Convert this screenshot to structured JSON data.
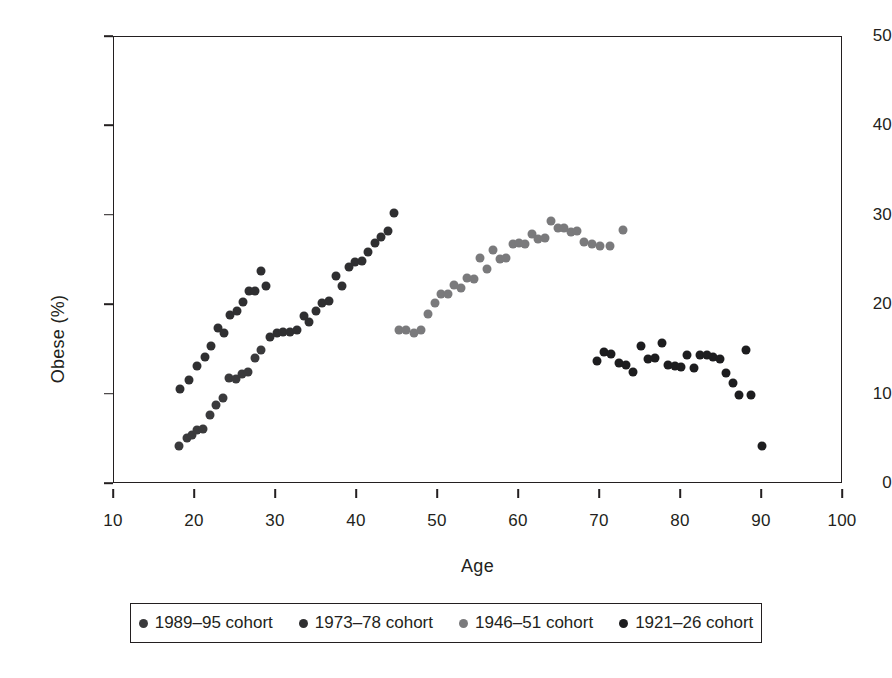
{
  "chart_data": {
    "type": "scatter",
    "title": "",
    "xlabel": "Age",
    "ylabel": "Obese (%)",
    "xlim": [
      10,
      100
    ],
    "ylim": [
      0,
      50
    ],
    "xticks": [
      10,
      20,
      30,
      40,
      50,
      60,
      70,
      80,
      90,
      100
    ],
    "yticks": [
      0,
      10,
      20,
      30,
      40,
      50
    ],
    "grid": false,
    "legend_position": "below",
    "marker_size_px": 9,
    "series": [
      {
        "name": "1989–95 cohort",
        "color": "#3a3a3c",
        "points": [
          [
            18.0,
            4.2
          ],
          [
            19.0,
            5.1
          ],
          [
            19.6,
            5.5
          ],
          [
            20.2,
            6.0
          ],
          [
            21.0,
            6.2
          ],
          [
            21.8,
            7.7
          ],
          [
            22.6,
            8.8
          ],
          [
            23.4,
            9.6
          ],
          [
            24.2,
            11.9
          ],
          [
            25.0,
            11.8
          ],
          [
            25.8,
            12.3
          ],
          [
            26.6,
            12.5
          ],
          [
            27.4,
            14.1
          ],
          [
            28.2,
            15.0
          ]
        ]
      },
      {
        "name": "1973–78 cohort",
        "color": "#2f2f31",
        "points": [
          [
            18.1,
            10.6
          ],
          [
            19.3,
            11.6
          ],
          [
            20.3,
            13.2
          ],
          [
            21.2,
            14.2
          ],
          [
            22.0,
            15.4
          ],
          [
            22.9,
            17.4
          ],
          [
            23.6,
            16.9
          ],
          [
            24.3,
            18.9
          ],
          [
            25.2,
            19.4
          ],
          [
            25.9,
            20.4
          ],
          [
            26.7,
            21.6
          ],
          [
            27.4,
            21.6
          ],
          [
            28.2,
            23.8
          ],
          [
            28.8,
            22.2
          ],
          [
            29.3,
            16.4
          ],
          [
            30.1,
            16.9
          ],
          [
            30.9,
            17.0
          ],
          [
            31.7,
            17.0
          ],
          [
            32.6,
            17.2
          ],
          [
            33.4,
            18.8
          ],
          [
            34.1,
            18.1
          ],
          [
            34.9,
            19.4
          ],
          [
            35.7,
            20.2
          ],
          [
            36.6,
            20.5
          ],
          [
            37.4,
            23.3
          ],
          [
            38.2,
            22.2
          ],
          [
            39.0,
            24.3
          ],
          [
            39.8,
            24.8
          ],
          [
            40.6,
            25.0
          ],
          [
            41.4,
            25.9
          ],
          [
            42.2,
            27.0
          ],
          [
            43.0,
            27.6
          ],
          [
            43.8,
            28.3
          ],
          [
            44.6,
            30.3
          ]
        ]
      },
      {
        "name": "1946–51 cohort",
        "color": "#7a7a7c",
        "points": [
          [
            45.2,
            17.2
          ],
          [
            46.1,
            17.2
          ],
          [
            47.0,
            16.9
          ],
          [
            47.9,
            17.2
          ],
          [
            48.8,
            19.0
          ],
          [
            49.6,
            20.3
          ],
          [
            50.4,
            21.2
          ],
          [
            51.2,
            21.2
          ],
          [
            52.0,
            22.3
          ],
          [
            52.8,
            21.9
          ],
          [
            53.6,
            23.0
          ],
          [
            54.4,
            22.9
          ],
          [
            55.2,
            25.3
          ],
          [
            56.0,
            24.1
          ],
          [
            56.8,
            26.2
          ],
          [
            57.6,
            25.2
          ],
          [
            58.4,
            25.3
          ],
          [
            59.2,
            26.8
          ],
          [
            60.0,
            27.0
          ],
          [
            60.8,
            26.9
          ],
          [
            61.6,
            28.0
          ],
          [
            62.4,
            27.4
          ],
          [
            63.2,
            27.5
          ],
          [
            64.0,
            29.4
          ],
          [
            64.8,
            28.6
          ],
          [
            65.6,
            28.6
          ],
          [
            66.4,
            28.2
          ],
          [
            67.2,
            28.3
          ],
          [
            68.0,
            27.1
          ],
          [
            69.0,
            26.9
          ],
          [
            70.0,
            26.6
          ],
          [
            71.2,
            26.6
          ],
          [
            72.8,
            28.4
          ]
        ]
      },
      {
        "name": "1921–26 cohort",
        "color": "#1d1d1f",
        "points": [
          [
            69.6,
            13.8
          ],
          [
            70.5,
            14.8
          ],
          [
            71.4,
            14.5
          ],
          [
            72.3,
            13.5
          ],
          [
            73.2,
            13.3
          ],
          [
            74.1,
            12.5
          ],
          [
            75.0,
            15.4
          ],
          [
            75.9,
            14.0
          ],
          [
            76.8,
            14.1
          ],
          [
            77.6,
            15.8
          ],
          [
            78.4,
            13.3
          ],
          [
            79.2,
            13.2
          ],
          [
            80.0,
            13.1
          ],
          [
            80.8,
            14.4
          ],
          [
            81.6,
            13.0
          ],
          [
            82.4,
            14.4
          ],
          [
            83.2,
            14.4
          ],
          [
            84.0,
            14.2
          ],
          [
            84.8,
            14.0
          ],
          [
            85.6,
            12.4
          ],
          [
            86.4,
            11.3
          ],
          [
            87.2,
            9.9
          ],
          [
            88.0,
            15.0
          ],
          [
            88.6,
            10.0
          ],
          [
            90.0,
            4.3
          ]
        ]
      }
    ]
  },
  "axes": {
    "x_label": "Age",
    "y_label": "Obese (%)",
    "x_tick_labels": [
      "10",
      "20",
      "30",
      "40",
      "50",
      "60",
      "70",
      "80",
      "90",
      "100"
    ],
    "y_tick_labels": [
      "0",
      "10",
      "20",
      "30",
      "40",
      "50"
    ]
  },
  "legend": {
    "entries": [
      {
        "label": "1989–95 cohort",
        "color": "#3a3a3c"
      },
      {
        "label": "1973–78 cohort",
        "color": "#2f2f31"
      },
      {
        "label": "1946–51 cohort",
        "color": "#7a7a7c"
      },
      {
        "label": "1921–26 cohort",
        "color": "#1d1d1f"
      }
    ]
  },
  "colors": {
    "axis": "#231f20",
    "background": "#ffffff"
  }
}
